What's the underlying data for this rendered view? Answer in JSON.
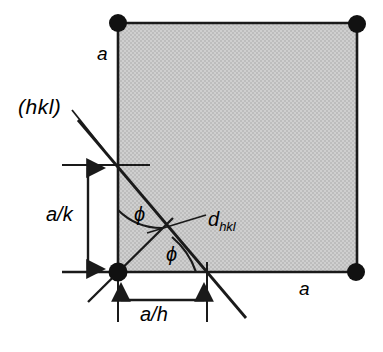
{
  "figure": {
    "colors": {
      "background": "#ffffff",
      "cell_fill": "#c8c8c8",
      "line": "#1a1a1a",
      "lattice_point": "#111111"
    },
    "labels": {
      "plane_index": "(hkl)",
      "lattice_param_left": "a",
      "lattice_param_bottom": "a",
      "intercept_k": "a/k",
      "intercept_h": "a/h",
      "interplanar_spacing_base": "d",
      "interplanar_spacing_sub": "hkl",
      "angle_upper": "ϕ",
      "angle_lower": "ϕ"
    },
    "geometry": {
      "cell": {
        "x_left": 118,
        "x_right": 357,
        "y_top": 23,
        "y_bottom": 272
      },
      "lattice_points": [
        {
          "x": 118,
          "y": 23
        },
        {
          "x": 357,
          "y": 24
        },
        {
          "x": 118,
          "y": 272
        },
        {
          "x": 356,
          "y": 272
        }
      ],
      "lattice_point_radius": 9,
      "plane_line": {
        "x1": 78,
        "y1": 120,
        "x2": 246,
        "y2": 318
      },
      "plane_intercept_vertical": {
        "x": 118,
        "y": 165
      },
      "plane_intercept_horizontal": {
        "x": 207,
        "y": 272
      },
      "normal_ray": {
        "x1": 90,
        "y1": 300,
        "x2": 172,
        "y2": 219
      },
      "normal_foot": {
        "x": 168,
        "y": 222
      },
      "dhkl_leader": {
        "x1": 148,
        "y1": 232,
        "x2": 205,
        "y2": 216
      },
      "dim_ak": {
        "x": 88,
        "y_top": 165,
        "y_bottom": 272
      },
      "dim_ah": {
        "y": 300,
        "x_left": 118,
        "x_right": 207
      },
      "arc_upper_radius": 62,
      "arc_lower_radius": 78
    }
  }
}
